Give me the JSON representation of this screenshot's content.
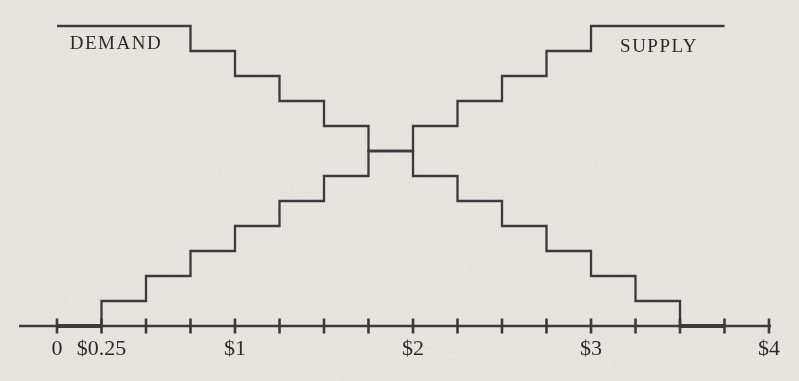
{
  "figure": {
    "paper_color": "#e8e6e1",
    "ink_color": "#3a3a3a",
    "text_color": "#2e2c29"
  },
  "chart_data": {
    "type": "line",
    "subtype": "step-functions",
    "title": "",
    "xlabel": "",
    "ylabel": "",
    "grid": false,
    "legend_position": "labels-inside-plot",
    "x_axis": {
      "min": 0,
      "max": 4,
      "tick_interval": 0.25,
      "tick_values": [
        0,
        0.25,
        0.5,
        0.75,
        1,
        1.25,
        1.5,
        1.75,
        2,
        2.25,
        2.5,
        2.75,
        3,
        3.25,
        3.5,
        3.75,
        4
      ],
      "labeled_ticks": [
        {
          "value": 0,
          "label": "0"
        },
        {
          "value": 0.25,
          "label": "$0.25"
        },
        {
          "value": 1,
          "label": "$1"
        },
        {
          "value": 2,
          "label": "$2"
        },
        {
          "value": 3,
          "label": "$3"
        },
        {
          "value": 4,
          "label": "$4"
        }
      ]
    },
    "y_axis": {
      "visible": false,
      "min_level": 0,
      "max_level": 12
    },
    "series": [
      {
        "name": "DEMAND",
        "direction": "descending-staircase",
        "points_price_level": [
          [
            0,
            12
          ],
          [
            0.75,
            12
          ],
          [
            0.75,
            11
          ],
          [
            1,
            11
          ],
          [
            1,
            10
          ],
          [
            1.25,
            10
          ],
          [
            1.25,
            9
          ],
          [
            1.5,
            9
          ],
          [
            1.5,
            8
          ],
          [
            1.75,
            8
          ],
          [
            1.75,
            7
          ],
          [
            2,
            7
          ],
          [
            2,
            6
          ],
          [
            2.25,
            6
          ],
          [
            2.25,
            5
          ],
          [
            2.5,
            5
          ],
          [
            2.5,
            4
          ],
          [
            2.75,
            4
          ],
          [
            2.75,
            3
          ],
          [
            3,
            3
          ],
          [
            3,
            2
          ],
          [
            3.25,
            2
          ],
          [
            3.25,
            1
          ],
          [
            3.5,
            1
          ],
          [
            3.5,
            0
          ],
          [
            3.75,
            0
          ]
        ]
      },
      {
        "name": "SUPPLY",
        "direction": "ascending-staircase",
        "points_price_level": [
          [
            0,
            0
          ],
          [
            0.25,
            0
          ],
          [
            0.25,
            1
          ],
          [
            0.5,
            1
          ],
          [
            0.5,
            2
          ],
          [
            0.75,
            2
          ],
          [
            0.75,
            3
          ],
          [
            1,
            3
          ],
          [
            1,
            4
          ],
          [
            1.25,
            4
          ],
          [
            1.25,
            5
          ],
          [
            1.5,
            5
          ],
          [
            1.5,
            6
          ],
          [
            1.75,
            6
          ],
          [
            1.75,
            7
          ],
          [
            2,
            7
          ],
          [
            2,
            8
          ],
          [
            2.25,
            8
          ],
          [
            2.25,
            9
          ],
          [
            2.5,
            9
          ],
          [
            2.5,
            10
          ],
          [
            2.75,
            10
          ],
          [
            2.75,
            11
          ],
          [
            3,
            11
          ],
          [
            3,
            12
          ],
          [
            3.75,
            12
          ]
        ]
      }
    ],
    "equilibrium": {
      "price_min": 1.75,
      "price_max": 2.0,
      "level": 7
    }
  }
}
